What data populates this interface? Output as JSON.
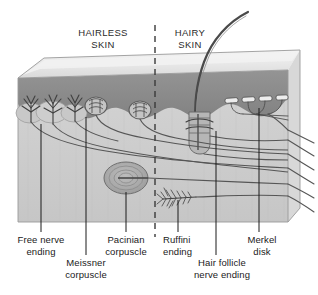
{
  "figure": {
    "background_color": "#ffffff",
    "width": 318,
    "height": 295
  },
  "colors": {
    "top_surface": "#e3e3e3",
    "top_surface_light": "#efefef",
    "bevel": "#cfcfcf",
    "epidermis": "#8c8c8c",
    "epidermis_dark": "#7c7c7c",
    "dermis": "#cdcdcd",
    "dermis_shadow": "#c2c2c2",
    "corpuscle_fill": "#b4b4b4",
    "corpuscle_stroke": "#6d6d6d",
    "nerve_line": "#555555",
    "leader_line": "#1b1b1b",
    "divider_line": "#3a3a3a",
    "text": "#1a1a1a"
  },
  "region_labels": [
    {
      "id": "hairless-skin",
      "line1": "HAIRLESS",
      "line2": "SKIN",
      "x": 103,
      "y": 36
    },
    {
      "id": "hairy-skin",
      "line1": "HAIRY",
      "line2": "SKIN",
      "x": 190,
      "y": 36
    }
  ],
  "divider": {
    "name": "hairless-hairy-divider",
    "x": 155,
    "y_top": 25,
    "y_bottom": 237,
    "style": "dashed"
  },
  "structure_labels": [
    {
      "id": "free-nerve-ending",
      "line1": "Free nerve",
      "line2": "ending",
      "text_x": 41,
      "text_y": 243,
      "align": "middle",
      "leader_x": 41,
      "leader_y_top": 124,
      "leader_y_bottom": 232
    },
    {
      "id": "meissner-corpuscle",
      "line1": "Meissner",
      "line2": "corpuscle",
      "text_x": 86,
      "text_y": 266,
      "align": "middle",
      "leader_x": 86,
      "leader_y_top": 117,
      "leader_y_bottom": 255
    },
    {
      "id": "pacinian-corpuscle",
      "line1": "Pacinian",
      "line2": "corpuscle",
      "text_x": 126,
      "text_y": 243,
      "align": "middle",
      "leader_x": 126,
      "leader_y_top": 192,
      "leader_y_bottom": 232
    },
    {
      "id": "ruffini-ending",
      "line1": "Ruffini",
      "line2": "ending",
      "text_x": 163,
      "text_y": 243,
      "align": "start",
      "leader_x": 178,
      "leader_y_top": 200,
      "leader_y_bottom": 232
    },
    {
      "id": "hair-follicle-nerve-ending",
      "line1": "Hair follicle",
      "line2": "nerve ending",
      "text_x": 222,
      "text_y": 266,
      "align": "middle",
      "leader_x": 216,
      "leader_y_top": 131,
      "leader_y_bottom": 255
    },
    {
      "id": "merkel-disk",
      "line1": "Merkel",
      "line2": "disk",
      "text_x": 262,
      "text_y": 243,
      "align": "middle",
      "leader_x": 259,
      "leader_y_top": 108,
      "leader_y_bottom": 232
    }
  ],
  "receptor_counts": {
    "free_nerve_endings": 3,
    "meissner_corpuscles": 2,
    "pacinian_corpuscles": 1,
    "ruffini_endings": 1,
    "hair_follicles": 1,
    "merkel_disks": 4,
    "exiting_nerve_fibers": 6
  },
  "skin_layers": [
    {
      "name": "epidermis",
      "label_visible": false
    },
    {
      "name": "dermis",
      "label_visible": false
    }
  ]
}
